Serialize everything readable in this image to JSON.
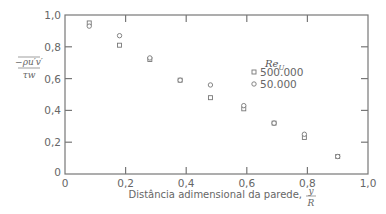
{
  "chart_data": {
    "type": "scatter",
    "title": "",
    "xlabel": "Distância adimensional da parede, y/R",
    "xlabel_text": "Distância adimensional da parede,",
    "xlabel_frac": {
      "num": "y",
      "den": "R"
    },
    "ylabel": "−ρ u′v′ / τw",
    "ylabel_num": "−ρu′v′",
    "ylabel_den": "τw",
    "xlim": [
      0,
      1.0
    ],
    "ylim": [
      0,
      1.0
    ],
    "xticks": [
      "0",
      "0,2",
      "0,4",
      "0,6",
      "0,8",
      "1,0"
    ],
    "yticks": [
      "0",
      "0,2",
      "0,4",
      "0,6",
      "0,8",
      "1,0"
    ],
    "grid": false,
    "legend": {
      "title": "Re",
      "title_sub": "U",
      "position": "upper right inside"
    },
    "series": [
      {
        "name": "500.000",
        "marker": "square",
        "x": [
          0.08,
          0.18,
          0.28,
          0.38,
          0.48,
          0.59,
          0.69,
          0.79,
          0.9
        ],
        "y": [
          0.95,
          0.81,
          0.72,
          0.59,
          0.48,
          0.41,
          0.32,
          0.23,
          0.11
        ]
      },
      {
        "name": "50.000",
        "marker": "circle",
        "x": [
          0.08,
          0.18,
          0.28,
          0.38,
          0.48,
          0.59,
          0.69,
          0.79,
          0.9
        ],
        "y": [
          0.93,
          0.87,
          0.73,
          0.59,
          0.56,
          0.43,
          0.32,
          0.25,
          0.11
        ]
      }
    ]
  }
}
